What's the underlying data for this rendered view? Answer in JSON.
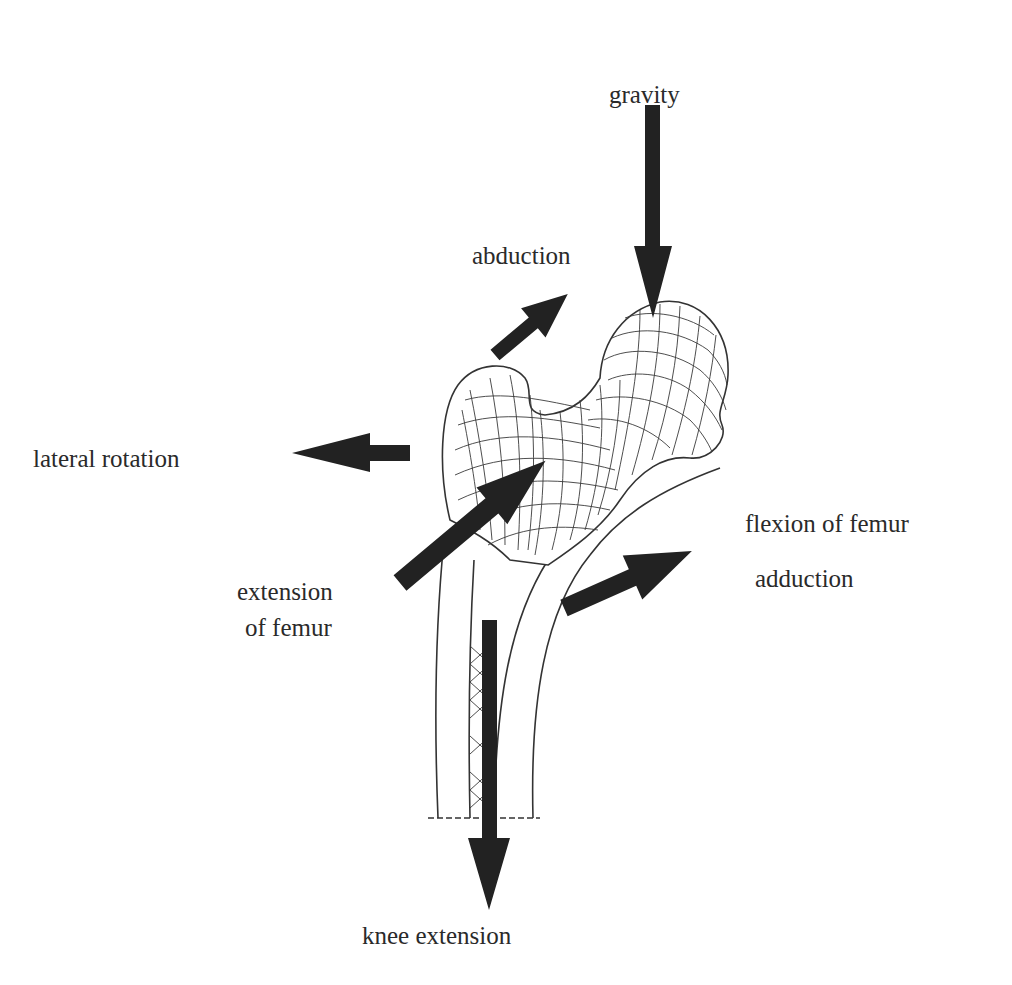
{
  "figure": {
    "background": "#ffffff",
    "arrow_color": "#222222",
    "text_color": "#2a2a2a"
  },
  "labels": {
    "gravity": "gravity",
    "abduction": "abduction",
    "lateral_rotation": "lateral rotation",
    "flexion_of_femur": "flexion of femur",
    "adduction": "adduction",
    "extension_line1": "extension",
    "extension_line2": "of femur",
    "knee_extension": "knee extension"
  },
  "arrows": [
    {
      "name": "gravity",
      "direction": "down"
    },
    {
      "name": "abduction",
      "direction": "up-right"
    },
    {
      "name": "lateral-rotation",
      "direction": "left"
    },
    {
      "name": "extension-of-femur",
      "direction": "up-right"
    },
    {
      "name": "flexion-adduction",
      "direction": "up-right"
    },
    {
      "name": "knee-extension",
      "direction": "down"
    }
  ]
}
